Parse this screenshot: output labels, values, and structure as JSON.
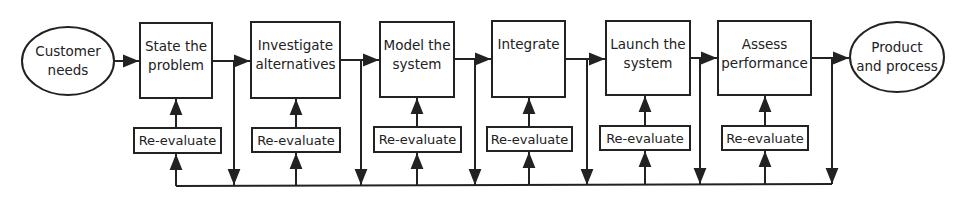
{
  "diagram": {
    "start": {
      "label": "Customer\nneeds"
    },
    "end": {
      "label": "Product\nand process"
    },
    "stages": [
      {
        "label": "State the\nproblem",
        "feedback": "Re-evaluate"
      },
      {
        "label": "Investigate\nalternatives",
        "feedback": "Re-evaluate"
      },
      {
        "label": "Model the\nsystem",
        "feedback": "Re-evaluate"
      },
      {
        "label": "Integrate",
        "feedback": "Re-evaluate"
      },
      {
        "label": "Launch the\nsystem",
        "feedback": "Re-evaluate"
      },
      {
        "label": "Assess\nperformance",
        "feedback": "Re-evaluate"
      }
    ],
    "colors": {
      "stroke": "#222222",
      "background": "#ffffff"
    }
  }
}
